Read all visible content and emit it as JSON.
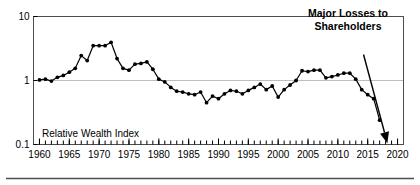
{
  "chart_data": {
    "type": "line",
    "title": "",
    "xlabel": "",
    "ylabel": "",
    "yscale": "log",
    "ylim": [
      0.1,
      10
    ],
    "xlim": [
      1959,
      2021
    ],
    "grid": "y=1 only",
    "legend": "none",
    "y_ticks": [
      "10",
      "1",
      "0.1"
    ],
    "y_tick_values": [
      10,
      1,
      0.1
    ],
    "x_ticks": [
      "1960",
      "1965",
      "1970",
      "1975",
      "1980",
      "1985",
      "1990",
      "1995",
      "2000",
      "2005",
      "2010",
      "2015",
      "2020"
    ],
    "x_tick_values": [
      1960,
      1965,
      1970,
      1975,
      1980,
      1985,
      1990,
      1995,
      2000,
      2005,
      2010,
      2015,
      2020
    ],
    "x_minor_tick_interval": 1,
    "series": [
      {
        "name": "Relative Wealth Index",
        "marker": "filled-circle",
        "color": "#000000",
        "x": [
          1960,
          1961,
          1962,
          1963,
          1964,
          1965,
          1966,
          1967,
          1968,
          1969,
          1970,
          1971,
          1972,
          1973,
          1974,
          1975,
          1976,
          1977,
          1978,
          1979,
          1980,
          1981,
          1982,
          1983,
          1984,
          1985,
          1986,
          1987,
          1988,
          1989,
          1990,
          1991,
          1992,
          1993,
          1994,
          1995,
          1996,
          1997,
          1998,
          1999,
          2000,
          2001,
          2002,
          2003,
          2004,
          2005,
          2006,
          2007,
          2008,
          2009,
          2010,
          2011,
          2012,
          2013,
          2014,
          2015,
          2016,
          2017
        ],
        "values": [
          1.02,
          1.05,
          0.98,
          1.12,
          1.2,
          1.35,
          1.55,
          2.45,
          2.05,
          3.5,
          3.5,
          3.5,
          3.95,
          2.2,
          1.55,
          1.45,
          1.8,
          1.85,
          1.95,
          1.5,
          1.05,
          0.95,
          0.78,
          0.68,
          0.66,
          0.62,
          0.6,
          0.66,
          0.45,
          0.57,
          0.52,
          0.62,
          0.7,
          0.68,
          0.62,
          0.7,
          0.78,
          0.88,
          0.72,
          0.82,
          0.55,
          0.72,
          0.85,
          1.0,
          1.42,
          1.38,
          1.45,
          1.45,
          1.1,
          1.15,
          1.22,
          1.3,
          1.3,
          1.05,
          0.72,
          0.6,
          0.52,
          0.24
        ]
      }
    ],
    "annotations": [
      {
        "id": "major-losses",
        "text_lines": [
          "Major Losses to",
          "Shareholders"
        ],
        "style": "bold",
        "arrow": {
          "from": [
            2014.3,
            2.55
          ],
          "to": [
            2018.3,
            0.105
          ]
        }
      },
      {
        "id": "series-label",
        "text_lines": [
          "Relative Wealth Index"
        ],
        "style": "normal"
      }
    ]
  },
  "colors": {
    "line": "#000000",
    "grid": "#bdbdbd",
    "frame": "#4d4d4d",
    "background": "#ffffff",
    "text": "#000000"
  }
}
